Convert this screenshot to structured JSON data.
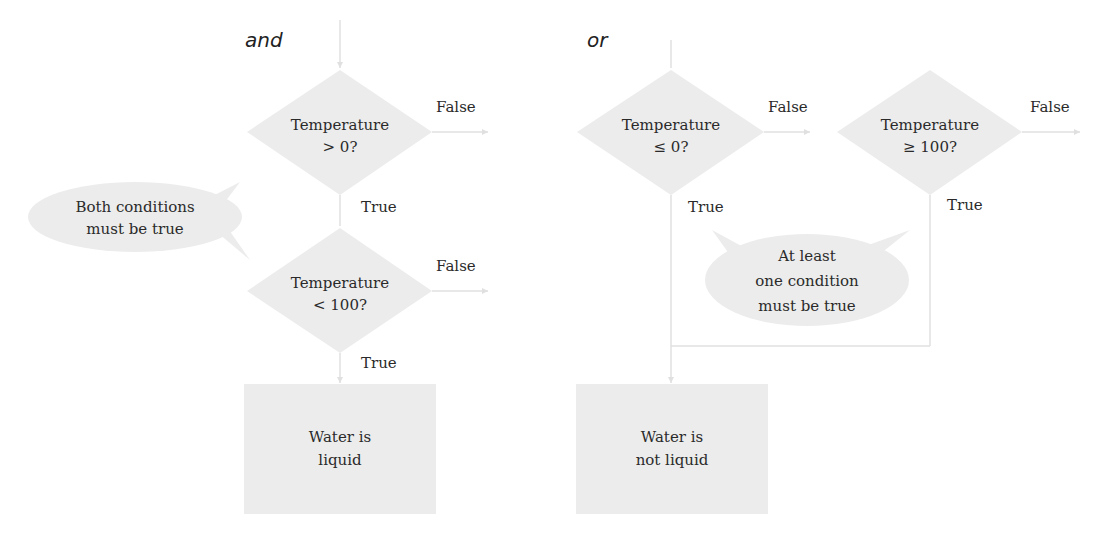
{
  "and_chart": {
    "heading": "and",
    "decision1": {
      "line1": "Temperature",
      "line2": "> 0?"
    },
    "decision2": {
      "line1": "Temperature",
      "line2": "< 100?"
    },
    "false1": "False",
    "true1": "True",
    "false2": "False",
    "true2": "True",
    "result": {
      "line1": "Water is",
      "line2": "liquid"
    },
    "callout": {
      "line1": "Both conditions",
      "line2": "must be true"
    }
  },
  "or_chart": {
    "heading": "or",
    "decision1": {
      "line1": "Temperature",
      "line2": "≤ 0?"
    },
    "decision2": {
      "line1": "Temperature",
      "line2": "≥ 100?"
    },
    "false1": "False",
    "true1": "True",
    "false2": "False",
    "true2": "True",
    "result": {
      "line1": "Water is",
      "line2": "not liquid"
    },
    "callout": {
      "line1": "At least",
      "line2": "one condition",
      "line3": "must be true"
    }
  },
  "colors": {
    "shape_fill": "#ececec",
    "line": "#d8d8d8",
    "text": "#2a2a2a"
  }
}
